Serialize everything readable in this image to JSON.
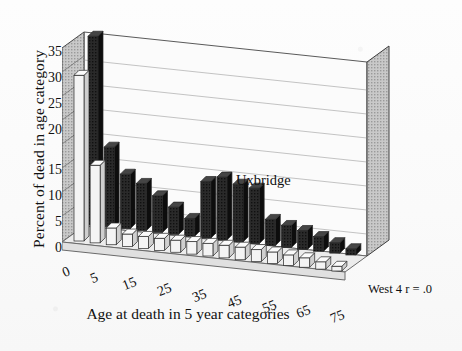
{
  "chart_data": {
    "type": "bar",
    "title": "",
    "subtitle": "",
    "xlabel": "Age at death in 5 year categories",
    "ylabel": "Percent of dead in age category",
    "ylim": [
      0,
      37
    ],
    "yticks": [
      0,
      5,
      10,
      15,
      20,
      25,
      30,
      35
    ],
    "grid": true,
    "grid_axis": "y",
    "legend_position": "in-plot-annotation",
    "projection": "3d-two-row",
    "categories": [
      "0",
      "5",
      "10",
      "15",
      "20",
      "25",
      "30",
      "35",
      "40",
      "45",
      "50",
      "55",
      "60",
      "65",
      "70",
      "75",
      "80"
    ],
    "xtick_labels_shown": [
      "0",
      "5",
      "15",
      "25",
      "35",
      "45",
      "55",
      "65",
      "75"
    ],
    "series": [
      {
        "name": "Uxbridge",
        "row": "back",
        "color": "#1b1b1b",
        "values": [
          36.0,
          15.2,
          10.4,
          9.0,
          7.0,
          5.2,
          3.4,
          10.8,
          12.0,
          11.0,
          10.6,
          5.0,
          4.2,
          3.6,
          2.8,
          2.0,
          1.2
        ]
      },
      {
        "name": "West 4",
        "row": "front",
        "color": "#f2f2f2",
        "values": [
          31.6,
          14.8,
          3.2,
          2.4,
          2.3,
          2.3,
          2.3,
          2.4,
          2.4,
          2.4,
          2.4,
          2.3,
          2.2,
          2.0,
          1.8,
          1.4,
          0.9
        ]
      }
    ],
    "annotations": [
      {
        "name": "uxbridge-label",
        "text": "Uxbridge"
      },
      {
        "name": "west-label",
        "text": "West 4  r = .0"
      }
    ]
  },
  "axes": {
    "ylabel": "Percent of dead in age category",
    "xlabel": "Age at death in 5 year categories",
    "yticks": [
      "35",
      "30",
      "25",
      "20",
      "15",
      "10",
      "5",
      "0"
    ],
    "xticks": [
      "0",
      "5",
      "15",
      "25",
      "35",
      "45",
      "55",
      "65",
      "75"
    ]
  },
  "annotations": {
    "uxbridge": "Uxbridge",
    "west": "West 4  r = .0"
  },
  "colors": {
    "back_series": "#1b1b1b",
    "front_series": "#f2f2f2",
    "wall": "#fbfbfb",
    "floor": "#e9e9e9",
    "side_wall": "#8f8f8f",
    "grid": "#b9b9b9"
  }
}
